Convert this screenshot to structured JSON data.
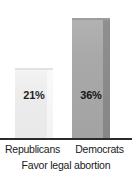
{
  "chart_data": {
    "type": "bar",
    "title": "",
    "caption": "Favor legal abortion",
    "xlabel": "",
    "ylabel": "",
    "categories": [
      "Republicans",
      "Democrats"
    ],
    "values": [
      21,
      36
    ],
    "value_labels": [
      "21%",
      "36%"
    ],
    "unit": "%",
    "ylim": [
      0,
      36
    ],
    "grid": false,
    "legend": null,
    "axis": {
      "baseline_visible": true,
      "ticks_visible": false,
      "tick_labels": []
    },
    "series": [
      {
        "name": "Favor legal abortion",
        "points": [
          {
            "category": "Republicans",
            "value": 21,
            "label": "21%",
            "color": "#ececed",
            "side_color": "#f5f5f5"
          },
          {
            "category": "Democrats",
            "value": 36,
            "label": "36%",
            "color": "#a9a9a9",
            "side_color": "#8a8a8a"
          }
        ]
      }
    ],
    "colors": {
      "background": "#ffffff",
      "baseline": "#2b2b2b",
      "text": "#1a1a1a",
      "bar_republicans": "#ececed",
      "bar_democrats": "#a9a9a9"
    }
  }
}
